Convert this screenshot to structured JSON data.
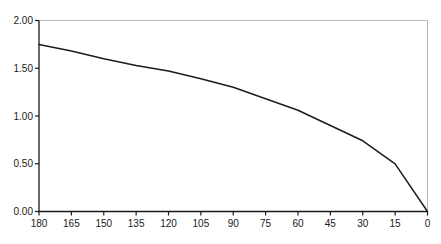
{
  "chart_data": {
    "type": "line",
    "title": "",
    "xlabel": "",
    "ylabel": "",
    "x_axis_reversed": true,
    "categories": [
      180,
      165,
      150,
      135,
      120,
      105,
      90,
      75,
      60,
      45,
      30,
      15,
      0
    ],
    "x_tick_labels": [
      "180",
      "165",
      "150",
      "135",
      "120",
      "105",
      "90",
      "75",
      "60",
      "45",
      "30",
      "15",
      "0"
    ],
    "values": [
      1.75,
      1.68,
      1.6,
      1.53,
      1.47,
      1.39,
      1.3,
      1.18,
      1.06,
      0.9,
      0.74,
      0.5,
      0.0
    ],
    "y_tick_values": [
      0,
      0.5,
      1.0,
      1.5,
      2.0
    ],
    "y_tick_labels": [
      "0.00",
      "0.50",
      "1.00",
      "1.50",
      "2.00"
    ],
    "xlim": [
      180,
      0
    ],
    "ylim": [
      0,
      2
    ],
    "grid": false,
    "legend": null,
    "colors": {
      "line": "#1c1c1c",
      "axis": "#1a1a1a",
      "plot_border": "#b8b8b8",
      "background": "#ffffff"
    }
  }
}
